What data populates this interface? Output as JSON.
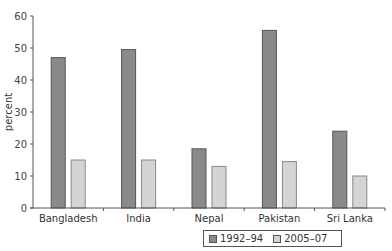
{
  "chart_data": {
    "type": "bar",
    "title": "",
    "xlabel": "",
    "ylabel": "percent",
    "ylim": [
      0,
      60
    ],
    "yticks": [
      0,
      10,
      20,
      30,
      40,
      50,
      60
    ],
    "grid": false,
    "legend_position": "bottom",
    "categories": [
      "Bangladesh",
      "India",
      "Nepal",
      "Pakistan",
      "Sri Lanka"
    ],
    "series": [
      {
        "name": "1992–94",
        "color": "#8a8a8a",
        "values": [
          47,
          49.5,
          18.5,
          55.5,
          24
        ]
      },
      {
        "name": "2005–07",
        "color": "#d4d4d4",
        "values": [
          15,
          15,
          13,
          14.5,
          10
        ]
      }
    ]
  }
}
